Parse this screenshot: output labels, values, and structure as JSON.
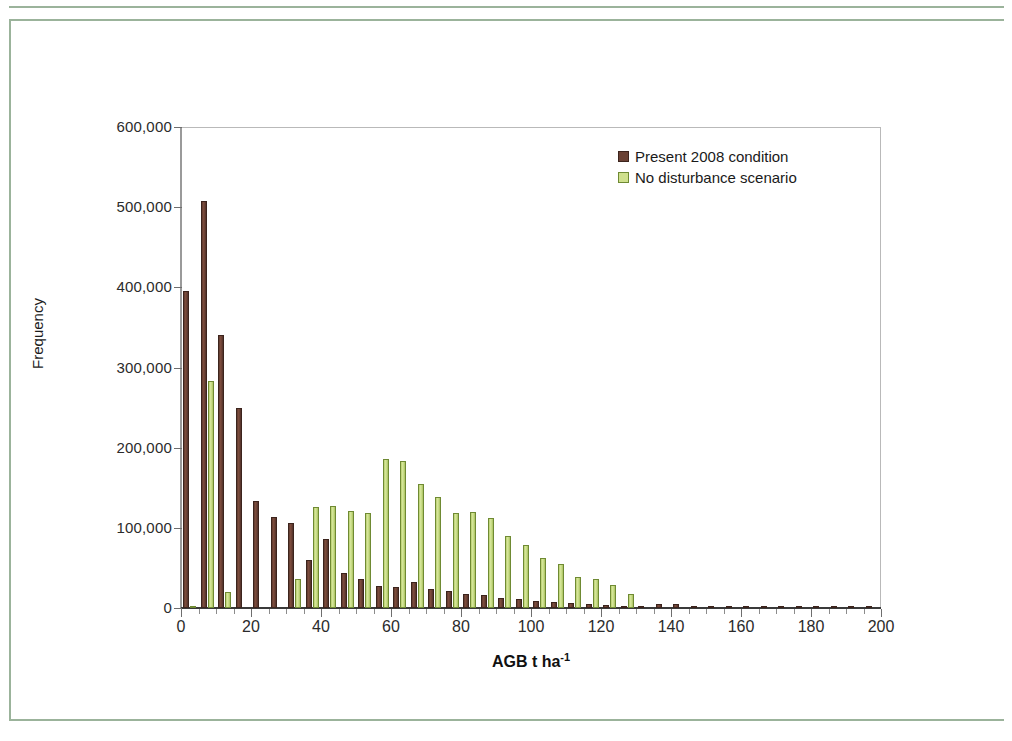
{
  "figure": {
    "border_color": "#9bb39b",
    "plot_background": "#ffffff"
  },
  "legend": {
    "position": "top-right",
    "entries": [
      {
        "label": "Present 2008 condition",
        "color": "#6a4134"
      },
      {
        "label": "No disturbance scenario",
        "color": "#cfe08d"
      }
    ]
  },
  "axes": {
    "y_title": "Frequency",
    "x_title_main": "AGB t ha",
    "x_title_sup": "-1",
    "y_ticks": [
      "0",
      "100,000",
      "200,000",
      "300,000",
      "400,000",
      "500,000",
      "600,000"
    ],
    "x_ticks": [
      "0",
      "20",
      "40",
      "60",
      "80",
      "100",
      "120",
      "140",
      "160",
      "180",
      "200"
    ]
  },
  "chart_data": {
    "type": "bar",
    "title": "",
    "subtitle": "",
    "xlabel": "AGB t ha-1",
    "ylabel": "Frequency",
    "xlim": [
      0,
      200
    ],
    "ylim": [
      0,
      600000
    ],
    "ytick_interval": 100000,
    "xtick_interval": 20,
    "xtick_minor_interval": 5,
    "grid": false,
    "legend_position": "top-right",
    "bar_group_width": 5,
    "categories": [
      0,
      5,
      10,
      15,
      20,
      25,
      30,
      35,
      40,
      45,
      50,
      55,
      60,
      65,
      70,
      75,
      80,
      85,
      90,
      95,
      100,
      105,
      110,
      115,
      120,
      125,
      130,
      135,
      140,
      145,
      150,
      155,
      160,
      165,
      170,
      175,
      180,
      185,
      190,
      195
    ],
    "series": [
      {
        "name": "Present 2008 condition",
        "color": "#6a4134",
        "values": [
          395000,
          508000,
          341000,
          249000,
          133000,
          114000,
          106000,
          60000,
          86000,
          44000,
          36000,
          28000,
          26000,
          33000,
          24000,
          21000,
          17000,
          16000,
          13000,
          11000,
          9000,
          7000,
          6000,
          4500,
          3500,
          2500,
          1800,
          5000,
          5000,
          3000,
          2500,
          2200,
          2000,
          1800,
          1500,
          1200,
          1000,
          900,
          700,
          500
        ]
      },
      {
        "name": "No disturbance scenario",
        "color": "#cfe08d",
        "values": [
          2000,
          283000,
          20000,
          0,
          0,
          0,
          36000,
          126000,
          127000,
          121000,
          119000,
          186000,
          184000,
          155000,
          138000,
          118000,
          120000,
          112000,
          90000,
          78000,
          62000,
          55000,
          39000,
          36000,
          29000,
          17000,
          0,
          0,
          0,
          0,
          0,
          0,
          0,
          0,
          0,
          0,
          0,
          0,
          0,
          0
        ]
      }
    ]
  }
}
